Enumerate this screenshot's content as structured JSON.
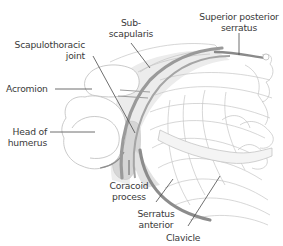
{
  "diagram": {
    "labels": {
      "subscapularis": {
        "line1": "Sub-",
        "line2": "scapularis"
      },
      "superior_posterior_serratus": {
        "line1": "Superior posterior",
        "line2": "serratus"
      },
      "scapulothoracic_joint": {
        "line1": "Scapulothoracic",
        "line2": "joint"
      },
      "acromion": {
        "line1": "Acromion"
      },
      "head_of_humerus": {
        "line1": "Head of",
        "line2": "humerus"
      },
      "coracoid_process": {
        "line1": "Coracoid",
        "line2": "process"
      },
      "serratus_anterior": {
        "line1": "Serratus",
        "line2": "anterior"
      },
      "clavicle": {
        "line1": "Clavicle"
      }
    },
    "colors": {
      "outline": "#b8b8b8",
      "muscle_band": "#8a8a8a",
      "shade": "#d9d9d9",
      "leader": "#4a4a4a",
      "text": "#3a3a3a"
    }
  }
}
